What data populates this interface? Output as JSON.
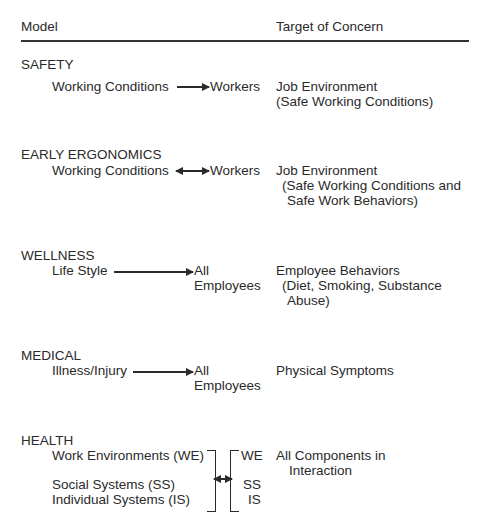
{
  "header": {
    "model": "Model",
    "target": "Target of Concern"
  },
  "models": [
    {
      "name": "SAFETY",
      "source": "Working Conditions",
      "arrow": "right",
      "recipient": "Workers",
      "target": [
        "Job Environment",
        "(Safe Working Conditions)"
      ]
    },
    {
      "name": "EARLY ERGONOMICS",
      "source": "Working Conditions",
      "arrow": "bidirectional",
      "recipient": "Workers",
      "target": [
        "Job Environment",
        "(Safe Working Conditions and",
        "Safe Work Behaviors)"
      ]
    },
    {
      "name": "WELLNESS",
      "source": "Life Style",
      "arrow": "right",
      "recipient": [
        "All",
        "Employees"
      ],
      "target": [
        "Employee Behaviors",
        "(Diet, Smoking, Substance",
        "Abuse)"
      ]
    },
    {
      "name": "MEDICAL",
      "source": "Illness/Injury",
      "arrow": "right",
      "recipient": [
        "All",
        "Employees"
      ],
      "target": [
        "Physical Symptoms"
      ]
    },
    {
      "name": "HEALTH",
      "source": [
        "Work Environments (WE)",
        "Social Systems (SS)",
        "Individual Systems (IS)"
      ],
      "arrow": "bidirectional-bracket",
      "recipient": [
        "WE",
        "SS",
        "IS"
      ],
      "target": [
        "All Components in",
        "Interaction"
      ]
    }
  ]
}
